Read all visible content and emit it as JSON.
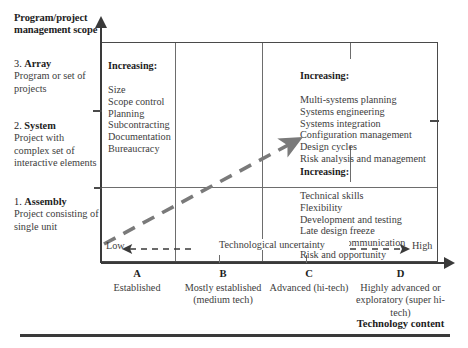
{
  "y_axis": {
    "title": "Program/project management scope",
    "levels": [
      {
        "number": "3.",
        "name": "Array",
        "description": "Program or set of projects"
      },
      {
        "number": "2.",
        "name": "System",
        "description": "Project with complex set of interactive elements"
      },
      {
        "number": "1.",
        "name": "Assembly",
        "description": "Project consisting of single unit"
      }
    ]
  },
  "boxes": {
    "scope_increasing": {
      "header": "Increasing:",
      "items": [
        "Size",
        "Scope control",
        "Planning",
        "Subcontracting",
        "Documentation",
        "Bureaucracy"
      ]
    },
    "systems_increasing": {
      "header": "Increasing:",
      "items": [
        "Multi-systems planning",
        "Systems engineering",
        "Systems integration",
        "Configuration management",
        "Design cycles",
        "Risk analysis and management"
      ]
    },
    "technical_increasing": {
      "header": "Increasing:",
      "items": [
        "Technical skills",
        "Flexibility",
        "Development and testing",
        "Late design freeze",
        "Technical communication",
        "Risk and opportunity"
      ]
    }
  },
  "uncertainty_axis": {
    "label": "Technological uncertainty",
    "low_label": "Low",
    "high_label": "High"
  },
  "x_axis": {
    "title": "Technology content",
    "categories": [
      {
        "letter": "A",
        "description": "Established"
      },
      {
        "letter": "B",
        "description": "Mostly established\n(medium tech)"
      },
      {
        "letter": "C",
        "description": "Advanced\n(hi-tech)"
      },
      {
        "letter": "D",
        "description": "Highly advanced\nor exploratory\n(super hi-tech)"
      }
    ]
  },
  "colors": {
    "ink": "#3a3a3a",
    "heading_ink": "#1d1d1d",
    "grid": "#6d6d6d",
    "dash_arrow": "#7a7a7a"
  }
}
